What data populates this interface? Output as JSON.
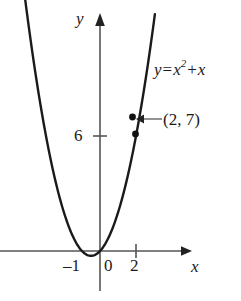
{
  "figure": {
    "type": "math-graph",
    "background_color": "#ffffff",
    "curve_color": "#1a1a1a",
    "axis_color": "#555555",
    "text_color": "#1a1a1a"
  },
  "axes": {
    "y_axis_label": "y",
    "x_axis_label": "x",
    "x_tick_labels": [
      "–1",
      "0",
      "2"
    ],
    "y_tick_labels": [
      "6"
    ]
  },
  "annotations": {
    "equation": {
      "lhs": "y",
      "equals": "=",
      "base": "x",
      "exponent": "2",
      "plus": "+",
      "term": "x",
      "full_text": "y = x² + x"
    },
    "point_label": "(2, 7)"
  },
  "chart_data": {
    "type": "line",
    "title": "",
    "xlabel": "x",
    "ylabel": "y",
    "equation": "y = x^2 + x",
    "xlim": [
      -5.6,
      4.7
    ],
    "ylim": [
      -1.5,
      12.5
    ],
    "grid": false,
    "legend": "none",
    "x_ticks": [
      -1,
      0,
      2
    ],
    "y_ticks": [
      6
    ],
    "vertex": [
      -0.5,
      -0.25
    ],
    "x_intercepts": [
      -1,
      0
    ],
    "points": [
      {
        "x": 2,
        "y": 6,
        "label": ""
      },
      {
        "x": 2,
        "y": 7,
        "label": "(2, 7)"
      }
    ],
    "series": [
      {
        "name": "y = x^2 + x",
        "x": [
          -4.4,
          -4.0,
          -3.5,
          -3.0,
          -2.5,
          -2.0,
          -1.5,
          -1.0,
          -0.5,
          0.0,
          0.5,
          1.0,
          1.5,
          2.0,
          2.5,
          3.0
        ],
        "values": [
          14.96,
          12.0,
          8.75,
          6.0,
          3.75,
          2.0,
          0.75,
          0.0,
          -0.25,
          0.0,
          0.75,
          2.0,
          3.75,
          6.0,
          8.75,
          12.0
        ]
      }
    ]
  }
}
